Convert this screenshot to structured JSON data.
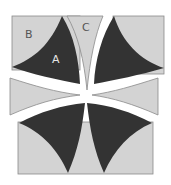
{
  "diagram": {
    "type": "quilt-block-pattern",
    "labels": {
      "a": "A",
      "b": "B",
      "c": "C"
    },
    "colors": {
      "light": "#d3d3d3",
      "dark": "#333333",
      "outline": "#8a8a8a",
      "label_on_light": "#555555",
      "label_on_dark": "#e6e6e6",
      "background": "#ffffff"
    }
  }
}
